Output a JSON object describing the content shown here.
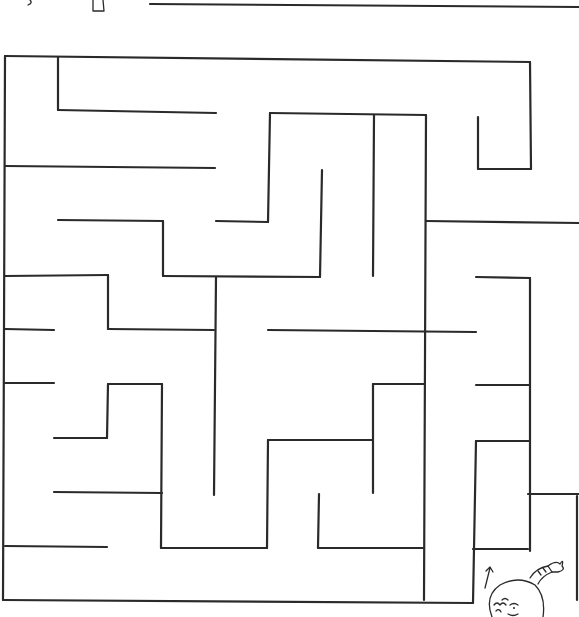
{
  "page": {
    "title": "Maze Puzzle",
    "background": "#ffffff",
    "line_color": "#2a2a2a"
  },
  "top_fragment": {
    "segments": [
      [
        150,
        4,
        579,
        7
      ]
    ],
    "small_shape": "trapezoid-fragment"
  },
  "maze": {
    "walls": [
      [
        5,
        56,
        530,
        62
      ],
      [
        5,
        56,
        3,
        600
      ],
      [
        58,
        57,
        58,
        110
      ],
      [
        58,
        110,
        216,
        113
      ],
      [
        5,
        166,
        215,
        168
      ],
      [
        58,
        220,
        163,
        221
      ],
      [
        163,
        221,
        163,
        276
      ],
      [
        163,
        276,
        320,
        277
      ],
      [
        216,
        221,
        268,
        222
      ],
      [
        268,
        222,
        270,
        113
      ],
      [
        270,
        113,
        426,
        115
      ],
      [
        322,
        170,
        320,
        277
      ],
      [
        374,
        115,
        373,
        276
      ],
      [
        426,
        115,
        424,
        600
      ],
      [
        530,
        62,
        531,
        169
      ],
      [
        478,
        117,
        478,
        169
      ],
      [
        478,
        169,
        531,
        169
      ],
      [
        426,
        221,
        579,
        223
      ],
      [
        5,
        276,
        108,
        275
      ],
      [
        108,
        275,
        108,
        329
      ],
      [
        108,
        329,
        214,
        330
      ],
      [
        216,
        277,
        214,
        495
      ],
      [
        5,
        329,
        54,
        330
      ],
      [
        268,
        330,
        476,
        332
      ],
      [
        476,
        277,
        530,
        278
      ],
      [
        530,
        278,
        530,
        551
      ],
      [
        476,
        385,
        530,
        385
      ],
      [
        5,
        383,
        54,
        383
      ],
      [
        108,
        384,
        107,
        438
      ],
      [
        108,
        384,
        162,
        384
      ],
      [
        162,
        384,
        161,
        548
      ],
      [
        54,
        438,
        107,
        438
      ],
      [
        54,
        492,
        162,
        493
      ],
      [
        5,
        546,
        107,
        547
      ],
      [
        161,
        548,
        267,
        548
      ],
      [
        267,
        548,
        268,
        440
      ],
      [
        268,
        440,
        373,
        440
      ],
      [
        373,
        384,
        373,
        493
      ],
      [
        373,
        384,
        424,
        384
      ],
      [
        319,
        494,
        318,
        548
      ],
      [
        318,
        548,
        423,
        548
      ],
      [
        476,
        441,
        530,
        441
      ],
      [
        476,
        441,
        473,
        603
      ],
      [
        473,
        549,
        528,
        549
      ],
      [
        528,
        494,
        579,
        494
      ],
      [
        3,
        600,
        473,
        603
      ]
    ],
    "partial_right_edge": [
      577,
      496,
      577,
      600
    ]
  },
  "start_marker": {
    "arrow_label": "↑",
    "arrow_position": [
      488,
      575
    ],
    "character": "child-peeking-figure"
  }
}
